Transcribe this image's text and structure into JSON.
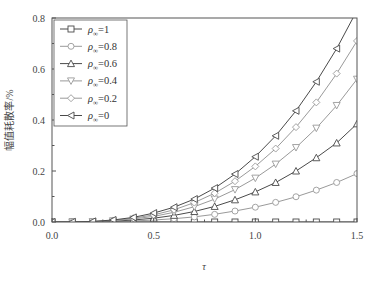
{
  "chart_data": {
    "type": "line",
    "title": "",
    "xlabel": "τ",
    "ylabel": "幅值耗散率/%",
    "xlim": [
      0,
      1.5
    ],
    "ylim": [
      0,
      0.8
    ],
    "xticks": [
      "0.0",
      "0.5",
      "1.0",
      "1.5"
    ],
    "yticks": [
      "0.0",
      "0.2",
      "0.4",
      "0.6",
      "0.8"
    ],
    "grid": false,
    "legend_position": "upper-left",
    "x": [
      0,
      0.1,
      0.2,
      0.3,
      0.4,
      0.5,
      0.6,
      0.7,
      0.8,
      0.9,
      1.0,
      1.1,
      1.2,
      1.3,
      1.4,
      1.5
    ],
    "series": [
      {
        "name": "ρ∞=1",
        "marker": "square",
        "values": [
          0,
          0,
          0,
          0,
          0,
          0,
          0,
          0,
          0,
          0,
          0,
          0,
          0,
          0,
          0,
          0
        ]
      },
      {
        "name": "ρ∞=0.8",
        "marker": "circle",
        "values": [
          0,
          0.0001,
          0.0005,
          0.0015,
          0.004,
          0.008,
          0.013,
          0.02,
          0.03,
          0.043,
          0.058,
          0.077,
          0.099,
          0.125,
          0.155,
          0.19
        ]
      },
      {
        "name": "ρ∞=0.6",
        "marker": "triangle-up",
        "values": [
          0,
          0.0002,
          0.001,
          0.003,
          0.008,
          0.015,
          0.026,
          0.041,
          0.061,
          0.087,
          0.118,
          0.155,
          0.2,
          0.252,
          0.31,
          0.385
        ]
      },
      {
        "name": "ρ∞=0.4",
        "marker": "triangle-down",
        "values": [
          0,
          0.0003,
          0.0015,
          0.005,
          0.012,
          0.022,
          0.038,
          0.06,
          0.09,
          0.127,
          0.172,
          0.227,
          0.292,
          0.368,
          0.457,
          0.56
        ]
      },
      {
        "name": "ρ∞=0.2",
        "marker": "diamond",
        "values": [
          0,
          0.0004,
          0.002,
          0.006,
          0.015,
          0.028,
          0.048,
          0.076,
          0.113,
          0.16,
          0.218,
          0.288,
          0.372,
          0.469,
          0.582,
          0.71
        ]
      },
      {
        "name": "ρ∞=0",
        "marker": "triangle-left",
        "values": [
          0,
          0.0005,
          0.0025,
          0.008,
          0.018,
          0.035,
          0.058,
          0.09,
          0.133,
          0.188,
          0.256,
          0.338,
          0.436,
          0.55,
          0.68,
          0.83
        ]
      }
    ]
  },
  "legend": {
    "items": [
      {
        "sym": "ρ",
        "sub": "∞",
        "val": "=1"
      },
      {
        "sym": "ρ",
        "sub": "∞",
        "val": "=0.8"
      },
      {
        "sym": "ρ",
        "sub": "∞",
        "val": "=0.6"
      },
      {
        "sym": "ρ",
        "sub": "∞",
        "val": "=0.4"
      },
      {
        "sym": "ρ",
        "sub": "∞",
        "val": "=0.2"
      },
      {
        "sym": "ρ",
        "sub": "∞",
        "val": "=0"
      }
    ]
  },
  "colors": {
    "line": "#4a4a4a",
    "axis": "#555555",
    "marker_fill": "#ffffff",
    "light_series": "#9a9a9a"
  }
}
